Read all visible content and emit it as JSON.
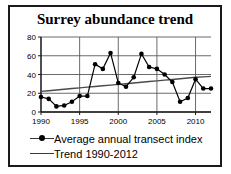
{
  "chart_data": {
    "type": "line",
    "title": "Surrey abundance trend",
    "xlabel": "",
    "ylabel": "",
    "xlim": [
      1990,
      2012
    ],
    "ylim": [
      0,
      80
    ],
    "ytick_values": [
      0,
      20,
      40,
      60,
      80
    ],
    "ytick_labels": [
      "0",
      "20",
      "40",
      "60",
      "80"
    ],
    "xtick_values": [
      1990,
      1995,
      2000,
      2005,
      2010
    ],
    "xtick_labels": [
      "1990",
      "1995",
      "2000",
      "2005",
      "2010"
    ],
    "grid": "horizontal-and-vertical-at-ticks",
    "legend_position": "below-axes-left",
    "x": [
      1990,
      1991,
      1992,
      1993,
      1994,
      1995,
      1996,
      1997,
      1998,
      1999,
      2000,
      2001,
      2002,
      2003,
      2004,
      2005,
      2006,
      2007,
      2008,
      2009,
      2010,
      2011,
      2012
    ],
    "series": [
      {
        "name": "Average annual transect index",
        "marker": "filled-circle",
        "color": "#000000",
        "values": [
          16,
          14,
          6,
          7,
          11,
          17,
          17,
          51,
          46,
          63,
          31,
          27,
          37,
          62,
          48,
          46,
          40,
          32,
          11,
          15,
          35,
          25,
          25
        ]
      },
      {
        "name": "Trend 1990-2012",
        "marker": "none",
        "color": "#4a4a4a",
        "values": [
          22,
          22.7,
          23.5,
          24.2,
          25,
          25.7,
          26.5,
          27.2,
          28,
          28.7,
          29.5,
          30.2,
          31,
          31.7,
          32.5,
          33.2,
          34,
          34.7,
          35.5,
          36.2,
          37,
          37.5,
          38
        ]
      }
    ]
  },
  "legend": {
    "items": [
      {
        "label": "Average annual transect index",
        "key": "line-with-marker"
      },
      {
        "label": "Trend 1990-2012",
        "key": "line-only"
      }
    ]
  }
}
